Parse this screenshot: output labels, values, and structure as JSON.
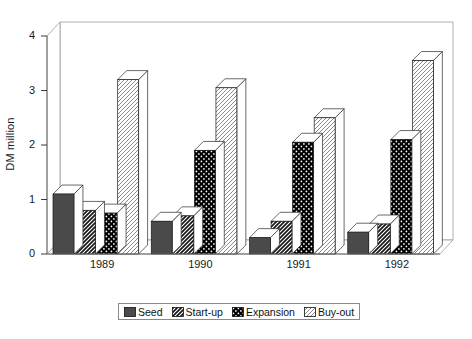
{
  "chart_data": {
    "type": "bar",
    "title": "",
    "subtitle": "",
    "xlabel": "",
    "ylabel": "DM million",
    "categories": [
      "1989",
      "1990",
      "1991",
      "1992"
    ],
    "series": [
      {
        "name": "Seed",
        "values": [
          1.1,
          0.6,
          0.3,
          0.4
        ],
        "fill": "solid-dark",
        "color": "#4d4d4d"
      },
      {
        "name": "Start-up",
        "values": [
          0.8,
          0.7,
          0.6,
          0.55
        ],
        "fill": "diagonal-hatch-dark",
        "color": "#1a1a1a"
      },
      {
        "name": "Expansion",
        "values": [
          0.75,
          1.9,
          2.05,
          2.1
        ],
        "fill": "black-dots",
        "color": "#000000"
      },
      {
        "name": "Buy-out",
        "values": [
          3.2,
          3.05,
          2.5,
          3.55
        ],
        "fill": "light-diagonal-hatch",
        "color": "#ffffff"
      }
    ],
    "ylim": [
      0,
      4
    ],
    "yticks": [
      0,
      1,
      2,
      3,
      4
    ],
    "ytick_labels": [
      "0",
      "1",
      "2",
      "3",
      "4"
    ],
    "grid": true,
    "grid_style": "dashed",
    "grid_color": "#b4b4b4",
    "legend_position": "bottom",
    "three_d": true
  },
  "legend": {
    "entries": [
      {
        "label": "Seed"
      },
      {
        "label": "Start-up"
      },
      {
        "label": "Expansion"
      },
      {
        "label": "Buy-out"
      }
    ]
  }
}
